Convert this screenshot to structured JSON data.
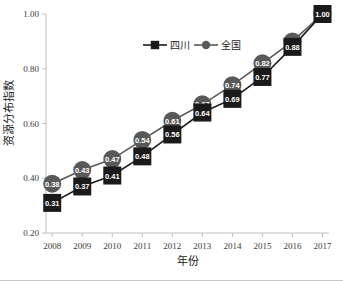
{
  "chart_data": {
    "type": "line",
    "title": "",
    "xlabel": "年份",
    "ylabel": "资源分布指数",
    "categories": [
      "2008",
      "2009",
      "2010",
      "2011",
      "2012",
      "2013",
      "2014",
      "2015",
      "2016",
      "2017"
    ],
    "x": [
      2008,
      2009,
      2010,
      2011,
      2012,
      2013,
      2014,
      2015,
      2016,
      2017
    ],
    "series": [
      {
        "name": "四川",
        "marker": "square",
        "color": "#1a1a1a",
        "values": [
          0.31,
          0.37,
          0.41,
          0.48,
          0.56,
          0.64,
          0.69,
          0.77,
          0.88,
          1.0
        ],
        "labels": [
          "0.31",
          "0.37",
          "0.41",
          "0.48",
          "0.56",
          "0.64",
          "0.69",
          "0.77",
          "0.88",
          "1.00"
        ]
      },
      {
        "name": "全国",
        "marker": "circle",
        "color": "#595959",
        "values": [
          0.38,
          0.43,
          0.47,
          0.54,
          0.61,
          0.67,
          0.74,
          0.82,
          0.9,
          1.0
        ],
        "labels": [
          "0.38",
          "0.43",
          "0.47",
          "0.54",
          "0.61",
          "0.67",
          "0.74",
          "0.82",
          "0.90",
          "1.00"
        ]
      }
    ],
    "ylim": [
      0.2,
      1.0
    ],
    "yticks": [
      0.2,
      0.4,
      0.6,
      0.8,
      1.0
    ],
    "ytick_labels": [
      "0.20",
      "0.40",
      "0.60",
      "0.80",
      "1.00"
    ],
    "grid": false,
    "legend_position": "top-center",
    "data_labels_shown": true
  },
  "legend": {
    "entries": [
      {
        "label": "四川",
        "marker": "square",
        "color": "#1a1a1a"
      },
      {
        "label": "全国",
        "marker": "circle",
        "color": "#595959"
      }
    ]
  },
  "axes": {
    "y_title": "资源分布指数",
    "x_title": "年份",
    "y_tick_labels": [
      "1.00",
      "0.80",
      "0.60",
      "0.40",
      "0.20"
    ],
    "x_tick_labels": [
      "2008",
      "2009",
      "2010",
      "2011",
      "2012",
      "2013",
      "2014",
      "2015",
      "2016",
      "2017"
    ]
  }
}
